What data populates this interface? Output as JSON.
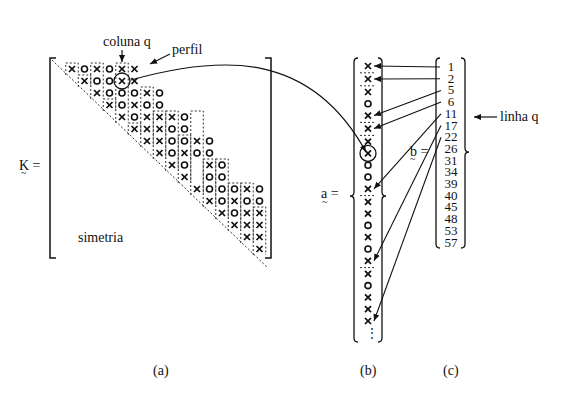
{
  "labels": {
    "coluna": "coluna q",
    "perfil": "perfil",
    "simetria": "simetria",
    "K_eq": "K =",
    "a_eq": "a =",
    "b_eq": "b =",
    "linha": "linha q",
    "panel_a": "(a)",
    "panel_b": "(b)",
    "panel_c": "(c)",
    "K": "K",
    "a": "a",
    "b": "b"
  },
  "matrix": {
    "size": 16,
    "rows": [
      [
        [
          0,
          "x"
        ],
        [
          1,
          "o"
        ],
        [
          2,
          "x"
        ],
        [
          3,
          "o"
        ],
        [
          4,
          "x"
        ],
        [
          5,
          "x"
        ]
      ],
      [
        [
          1,
          "x"
        ],
        [
          2,
          "o"
        ],
        [
          3,
          "o"
        ],
        [
          4,
          "X"
        ],
        [
          5,
          "x"
        ]
      ],
      [
        [
          2,
          "x"
        ],
        [
          3,
          "o"
        ],
        [
          4,
          "o"
        ],
        [
          5,
          "o"
        ],
        [
          6,
          "x"
        ],
        [
          7,
          "o"
        ]
      ],
      [
        [
          3,
          "x"
        ],
        [
          4,
          "o"
        ],
        [
          5,
          "x"
        ],
        [
          6,
          "o"
        ],
        [
          7,
          "o"
        ]
      ],
      [
        [
          4,
          "x"
        ],
        [
          5,
          "o"
        ],
        [
          6,
          "x"
        ],
        [
          7,
          "x"
        ],
        [
          8,
          "x"
        ],
        [
          9,
          "o"
        ]
      ],
      [
        [
          5,
          "x"
        ],
        [
          6,
          "x"
        ],
        [
          7,
          "x"
        ],
        [
          8,
          "o"
        ],
        [
          9,
          "o"
        ]
      ],
      [
        [
          6,
          "x"
        ],
        [
          7,
          "x"
        ],
        [
          8,
          "o"
        ],
        [
          9,
          "o"
        ],
        [
          10,
          "x"
        ],
        [
          11,
          "o"
        ]
      ],
      [
        [
          7,
          "x"
        ],
        [
          8,
          "o"
        ],
        [
          9,
          "x"
        ],
        [
          10,
          "o"
        ],
        [
          11,
          "o"
        ]
      ],
      [
        [
          8,
          "x"
        ],
        [
          9,
          "o"
        ],
        [
          11,
          "x"
        ],
        [
          12,
          "o"
        ]
      ],
      [
        [
          9,
          "x"
        ],
        [
          11,
          "o"
        ],
        [
          12,
          "o"
        ]
      ],
      [
        [
          10,
          "x"
        ],
        [
          11,
          "o"
        ],
        [
          12,
          "o"
        ],
        [
          13,
          "o"
        ],
        [
          14,
          "x"
        ],
        [
          15,
          "o"
        ]
      ],
      [
        [
          11,
          "x"
        ],
        [
          12,
          "o"
        ],
        [
          13,
          "x"
        ],
        [
          14,
          "o"
        ],
        [
          15,
          "o"
        ]
      ],
      [
        [
          12,
          "x"
        ],
        [
          13,
          "o"
        ],
        [
          14,
          "x"
        ],
        [
          15,
          "x"
        ]
      ],
      [
        [
          13,
          "x"
        ],
        [
          14,
          "x"
        ],
        [
          15,
          "x"
        ]
      ],
      [
        [
          14,
          "x"
        ],
        [
          15,
          "x"
        ]
      ],
      [
        [
          15,
          "x"
        ]
      ]
    ],
    "column_heights": [
      1,
      1,
      3,
      1,
      5,
      1,
      5,
      4,
      5,
      4,
      7,
      4,
      5,
      4,
      5,
      4
    ]
  },
  "vector_a": {
    "entries": [
      "x",
      "x",
      "x",
      "o",
      "x",
      "x",
      "x",
      "X",
      "o",
      "o",
      "x",
      "x",
      "x",
      "o",
      "x",
      "o",
      "x",
      "x",
      "o",
      "x",
      "x",
      "x"
    ],
    "column_breaks_after": [
      0,
      1,
      4,
      5,
      10,
      16
    ],
    "ellipsis": "⋮"
  },
  "vector_b": {
    "values": [
      "1",
      "2",
      "5",
      "6",
      "11",
      "17",
      "22",
      "26",
      "31",
      "34",
      "39",
      "40",
      "45",
      "48",
      "53",
      "57"
    ],
    "arrow_targets": [
      0,
      1,
      4,
      5,
      10,
      16,
      21
    ]
  }
}
